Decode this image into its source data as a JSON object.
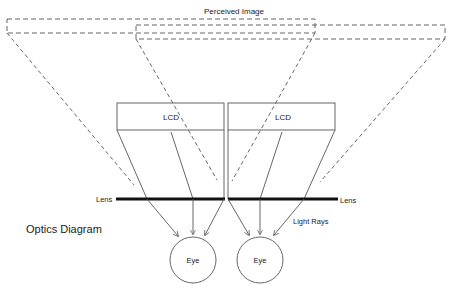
{
  "diagram": {
    "title": "Optics Diagram",
    "perceived_image_label": "Perceived Image",
    "lcd_left_label": "LCD",
    "lcd_right_label": "LCD",
    "lens_left_label": "Lens",
    "lens_right_label": "Lens",
    "light_rays_label": "Light Rays",
    "eye_left_label": "Eye",
    "eye_right_label": "Eye",
    "colors": {
      "stroke": "#555555",
      "lens": "#111111",
      "text": "#222222"
    }
  }
}
